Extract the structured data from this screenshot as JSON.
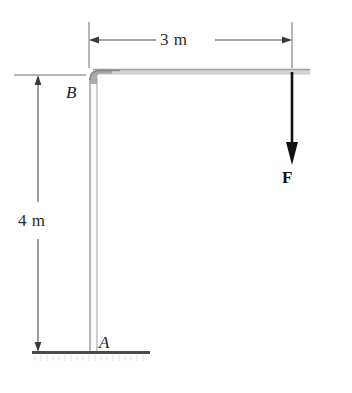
{
  "figure": {
    "type": "statics-free-body-diagram",
    "labels": {
      "dimension_horizontal": "3 m",
      "dimension_vertical": "4 m",
      "point_base": "A",
      "point_corner": "B",
      "force": "F"
    },
    "colors": {
      "member": "#a8a8a8",
      "member_shade": "#8e8e8e",
      "dimension_line": "#555555",
      "force_arrow": "#111111",
      "ground": "#4a4a4a",
      "hatch": "#c9c9c9",
      "background": "#ffffff"
    },
    "geometry": {
      "column_x": 93,
      "column_top_y": 73,
      "column_base_y": 352,
      "beam_y": 71,
      "beam_end_x": 310,
      "force_x": 292,
      "force_tail_y": 74,
      "force_tip_y": 164,
      "dim_h_left_x": 89,
      "dim_h_right_x": 292,
      "dim_h_y": 40,
      "dim_v_x": 38,
      "dim_v_top_y": 75,
      "dim_v_bottom_y": 352,
      "ground_left_x": 32,
      "ground_right_x": 150,
      "ground_y": 352
    }
  }
}
